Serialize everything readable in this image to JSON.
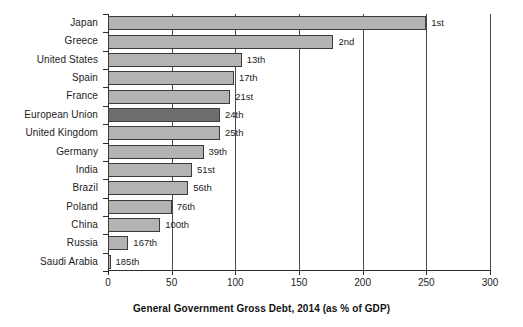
{
  "chart_data": {
    "type": "bar",
    "orientation": "horizontal",
    "title": "",
    "xlabel": "General Government Gross Debt, 2014 (as % of GDP)",
    "ylabel": "",
    "xlim": [
      0,
      300
    ],
    "ylim": null,
    "grid": true,
    "legend": null,
    "xticks": [
      0,
      50,
      100,
      150,
      200,
      250,
      300
    ],
    "xtick_labels": [
      "0",
      "50",
      "100",
      "150",
      "200",
      "250",
      "300"
    ],
    "categories": [
      "Japan",
      "Greece",
      "United States",
      "Spain",
      "France",
      "European Union",
      "United Kingdom",
      "Germany",
      "India",
      "Brazil",
      "Poland",
      "China",
      "Russia",
      "Saudi Arabia"
    ],
    "values": [
      250,
      177,
      105,
      99,
      96,
      88,
      88,
      75,
      66,
      63,
      50,
      41,
      16,
      2
    ],
    "annotations": [
      "1st",
      "2nd",
      "13th",
      "17th",
      "21st",
      "24th",
      "25th",
      "39th",
      "51st",
      "56th",
      "76th",
      "100th",
      "167th",
      "185th"
    ],
    "highlight_index": 5,
    "colors": {
      "bar": "#b3b3b3",
      "bar_highlight": "#6e6e6e",
      "bar_border": "#3c3c3c",
      "axis": "#2b2b2b",
      "grid": "#4a4a4a",
      "text": "#1c1c1c",
      "background": "#ffffff"
    }
  }
}
